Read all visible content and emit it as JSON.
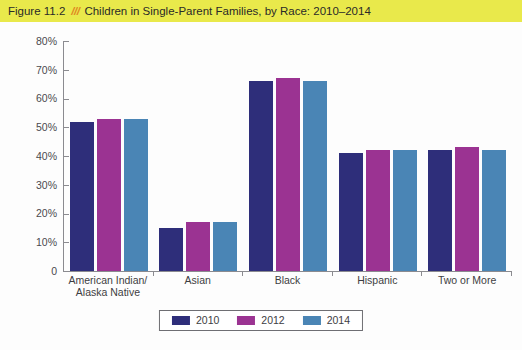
{
  "banner": {
    "figure_label": "Figure 11.2",
    "separator": "///",
    "title": "Children in Single-Parent Families, by Race: 2010–2014",
    "background_color": "#e9e94b",
    "separator_color": "#e08a22"
  },
  "chart_data": {
    "type": "bar",
    "title": "Children in Single-Parent Families, by Race: 2010–2014",
    "xlabel": "",
    "ylabel": "",
    "ylim": [
      0,
      80
    ],
    "ytick_labels": [
      "80%",
      "70%",
      "60%",
      "50%",
      "40%",
      "30%",
      "20%",
      "10%",
      "0"
    ],
    "ytick_values": [
      80,
      70,
      60,
      50,
      40,
      30,
      20,
      10,
      0
    ],
    "grid": false,
    "legend_position": "bottom-center",
    "categories": [
      "American Indian/\nAlaska Native",
      "Asian",
      "Black",
      "Hispanic",
      "Two or More"
    ],
    "category_lines": [
      [
        "American Indian/",
        "Alaska Native"
      ],
      [
        "Asian",
        ""
      ],
      [
        "Black",
        ""
      ],
      [
        "Hispanic",
        ""
      ],
      [
        "Two or More",
        ""
      ]
    ],
    "series": [
      {
        "name": "2010",
        "color": "#2e2e7a",
        "values": [
          52,
          15,
          66,
          41,
          42
        ]
      },
      {
        "name": "2012",
        "color": "#9b3392",
        "values": [
          53,
          17,
          67,
          42,
          43
        ]
      },
      {
        "name": "2014",
        "color": "#4a85b5",
        "values": [
          53,
          17,
          66,
          42,
          42
        ]
      }
    ]
  },
  "axis": {
    "line_color": "#8b8b90"
  }
}
